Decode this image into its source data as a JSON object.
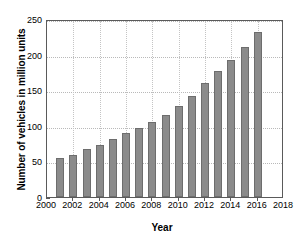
{
  "chart_data": {
    "type": "bar",
    "title": "",
    "xlabel": "Year",
    "ylabel": "Number of vehicles in million units",
    "categories": [
      2001,
      2002,
      2003,
      2004,
      2005,
      2006,
      2007,
      2008,
      2009,
      2010,
      2011,
      2012,
      2013,
      2014,
      2015,
      2016
    ],
    "values": [
      55,
      59,
      67,
      73,
      82,
      90,
      97,
      106,
      115,
      128,
      142,
      160,
      177,
      192,
      211,
      232
    ],
    "xlim": [
      2000,
      2018
    ],
    "ylim": [
      0,
      250
    ],
    "xticks": [
      "2000",
      "2002",
      "2004",
      "2006",
      "2008",
      "2010",
      "2012",
      "2014",
      "2016",
      "2018"
    ],
    "xtick_values": [
      2000,
      2002,
      2004,
      2006,
      2008,
      2010,
      2012,
      2014,
      2016,
      2018
    ],
    "yticks": [
      "0",
      "50",
      "100",
      "150",
      "200",
      "250"
    ],
    "ytick_values": [
      0,
      50,
      100,
      150,
      200,
      250
    ],
    "grid": true,
    "legend": null,
    "bar_color": "#8b8b8b",
    "bar_edge_color": "#6d6d6d",
    "axis_color": "#5a5a5a",
    "grid_color": "#b9b9b9",
    "background": "#ffffff"
  }
}
